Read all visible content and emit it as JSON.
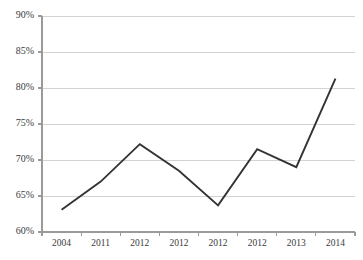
{
  "chart_data": {
    "type": "line",
    "title": "",
    "subtitle": "",
    "xlabel": "",
    "ylabel": "",
    "categories": [
      "2004",
      "2011",
      "2012",
      "2012",
      "2012",
      "2012",
      "2013",
      "2014"
    ],
    "values": [
      63.1,
      67.0,
      72.2,
      68.5,
      63.7,
      71.5,
      69.0,
      81.3
    ],
    "series": [
      {
        "name": "",
        "values": [
          63.1,
          67.0,
          72.2,
          68.5,
          63.7,
          71.5,
          69.0,
          81.3
        ]
      }
    ],
    "ylim": [
      60,
      90
    ],
    "ytick_values": [
      60,
      65,
      70,
      75,
      80,
      85,
      90
    ],
    "ytick_labels": [
      "60%",
      "65%",
      "70%",
      "75%",
      "80%",
      "85%",
      "90%"
    ],
    "xtick_labels": [
      "2004",
      "2011",
      "2012",
      "2012",
      "2012",
      "2012",
      "2013",
      "2014"
    ],
    "grid": true,
    "grid_axis": "y",
    "legend": false,
    "legend_position": "none",
    "annotations": [],
    "value_unit": "percent"
  },
  "style": {
    "background": "#ffffff",
    "line_color": "#333333",
    "grid_color": "#c8c8c8",
    "axis_color": "#9a9a9a",
    "tick_label_color": "#3a3a3a"
  },
  "layout": {
    "width": 363,
    "height": 260,
    "plot_left": 42,
    "plot_right": 355,
    "plot_top": 16,
    "plot_bottom": 232
  }
}
